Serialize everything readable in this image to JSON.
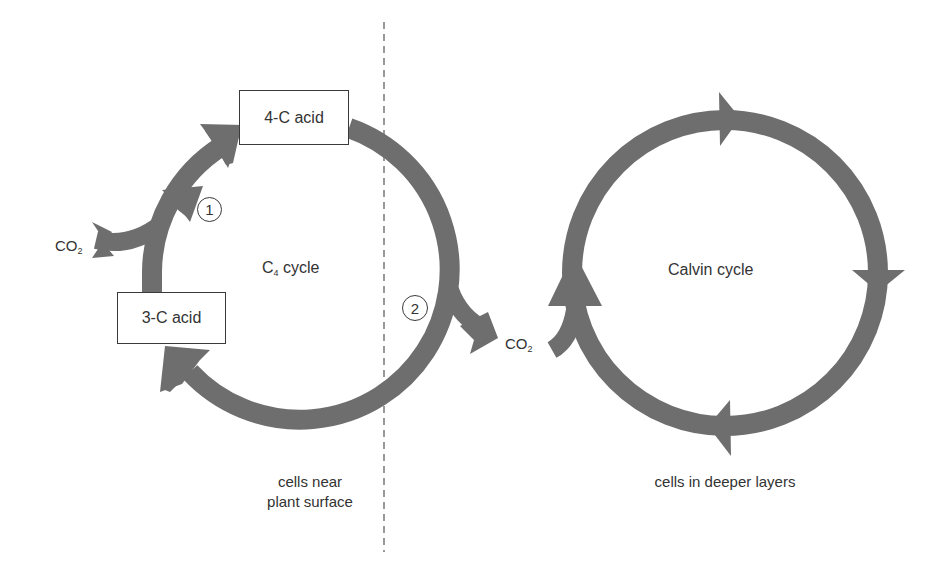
{
  "diagram": {
    "colors": {
      "arrow": "#6e6e6e",
      "text": "#333333",
      "divider": "#555555"
    },
    "c4_cycle": {
      "label_main": "C",
      "label_sub": "4",
      "label_rest": " cycle",
      "nodes": [
        {
          "id": "four_c_acid",
          "label": "4-C acid"
        },
        {
          "id": "three_c_acid",
          "label": "3-C acid"
        }
      ],
      "co2_input": {
        "label_main": "CO",
        "label_sub": "2"
      },
      "steps": [
        {
          "number": "1",
          "description": "CO2 fixation: 3-C acid + CO2 to 4-C acid"
        },
        {
          "number": "2",
          "description": "CO2 release toward Calvin cycle"
        }
      ]
    },
    "transfer": {
      "co2_label_main": "CO",
      "co2_label_sub": "2"
    },
    "calvin_cycle": {
      "label": "Calvin cycle"
    },
    "regions": {
      "left": {
        "line1": "cells near",
        "line2": "plant surface"
      },
      "right": {
        "line1": "cells in deeper layers"
      }
    }
  }
}
